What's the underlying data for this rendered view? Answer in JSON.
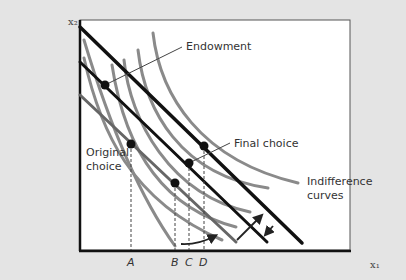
{
  "diagram": {
    "type": "economics-indifference-curves",
    "axes": {
      "x_label": "x₁",
      "y_label": "x₂"
    },
    "ticks": [
      "A",
      "B",
      "C",
      "D"
    ],
    "labels": {
      "endowment": "Endowment",
      "final_choice": "Final choice",
      "original_choice_line1": "Original",
      "original_choice_line2": "choice",
      "indifference_line1": "Indifference",
      "indifference_line2": "curves"
    },
    "points": [
      {
        "name": "Endowment",
        "x": 105,
        "y": 85
      },
      {
        "name": "Original choice",
        "x": 131,
        "y": 144
      },
      {
        "name": "B",
        "x": 175,
        "y": 183
      },
      {
        "name": "C (Final choice)",
        "x": 189,
        "y": 163
      },
      {
        "name": "D",
        "x": 204,
        "y": 146
      }
    ],
    "colors": {
      "background": "#e4e4e4",
      "plot": "#ffffff",
      "budget_line": "#111111",
      "indifference_curve": "#8c8c8c"
    }
  }
}
